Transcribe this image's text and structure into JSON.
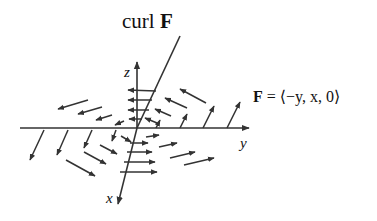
{
  "figure": {
    "title": {
      "prefix": "curl ",
      "bold": "F"
    },
    "formula": {
      "lhs": "F",
      "rest": " = ⟨−y, x, 0⟩"
    },
    "axes": {
      "x_label": "x",
      "y_label": "y",
      "z_label": "z"
    },
    "colors": {
      "ink": "#333333",
      "background": "#ffffff"
    }
  }
}
